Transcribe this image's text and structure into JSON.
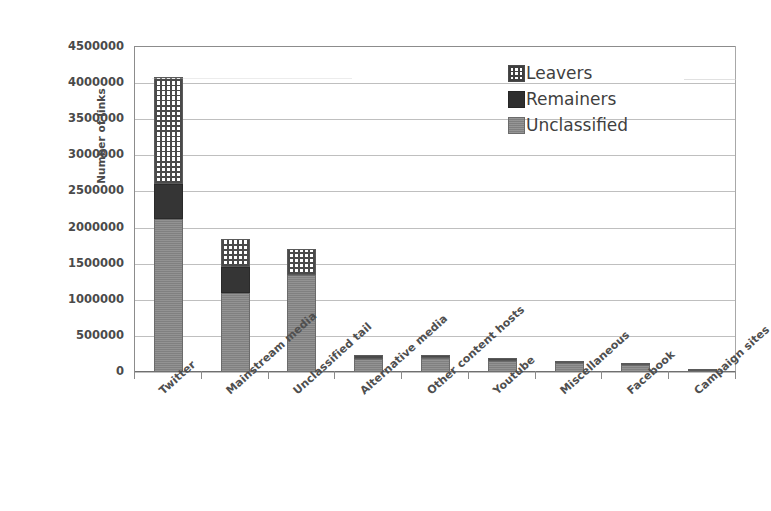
{
  "chart_data": {
    "type": "bar",
    "subtype": "stacked-vertical",
    "title": "",
    "xlabel": "",
    "ylabel": "Number of links",
    "ylim": [
      0,
      4500000
    ],
    "ytick_step": 500000,
    "ytick_labels": [
      "4500000",
      "4000000",
      "3500000",
      "3000000",
      "2500000",
      "2000000",
      "1500000",
      "1000000",
      "500000",
      "0"
    ],
    "ytick_values": [
      4500000,
      4000000,
      3500000,
      3000000,
      2500000,
      2000000,
      1500000,
      1000000,
      500000,
      0
    ],
    "grid": true,
    "grid_axis": "y",
    "legend_position": "top-right",
    "categories": [
      "Twitter",
      "Mainstream media",
      "Unclassified tail",
      "Alternative media",
      "Other content hosts",
      "Youtube",
      "Miscellaneous",
      "Facebook",
      "Campaign sites"
    ],
    "series": [
      {
        "name": "Unclassified",
        "color": "#878787",
        "pattern": "solid-gray",
        "values": [
          2120000,
          1100000,
          1350000,
          175000,
          200000,
          155000,
          120000,
          95000,
          12000
        ]
      },
      {
        "name": "Remainers",
        "color": "#353535",
        "pattern": "solid-dark",
        "values": [
          480000,
          350000,
          0,
          0,
          0,
          0,
          0,
          0,
          0
        ]
      },
      {
        "name": "Leavers",
        "color": "#ffffff",
        "pattern": "crosshatch-grid",
        "values": [
          1480000,
          390000,
          350000,
          55000,
          30000,
          35000,
          20000,
          10000,
          8000
        ]
      }
    ],
    "totals": [
      4080000,
      1840000,
      1700000,
      230000,
      230000,
      190000,
      140000,
      105000,
      20000
    ],
    "annotations": []
  },
  "legend": {
    "items": [
      {
        "label": "Leavers",
        "swatch": "crosshatch-swatch-icon"
      },
      {
        "label": "Remainers",
        "swatch": "dark-solid-swatch-icon"
      },
      {
        "label": "Unclassified",
        "swatch": "gray-solid-swatch-icon"
      }
    ]
  },
  "colors": {
    "unclassified": "#878787",
    "remainers": "#353535",
    "leavers": "#ffffff",
    "leavers_hatch": "#4a4a4a",
    "gridline": "#bfbfbf",
    "axis": "#8c8c8c",
    "text": "#4a4a4a",
    "background": "#ffffff"
  }
}
